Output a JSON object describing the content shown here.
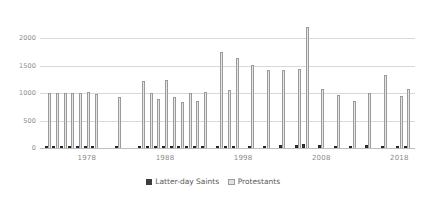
{
  "chart_data": {
    "type": "bar",
    "title": "",
    "subtitle": "",
    "xlabel": "",
    "ylabel": "",
    "ylim": [
      0,
      2300
    ],
    "grid": true,
    "legend_position": "bottom-center",
    "y_ticks": [
      0,
      500,
      1000,
      1500,
      2000
    ],
    "y_tick_labels": [
      "0",
      "500",
      "1000",
      "1500",
      "2000"
    ],
    "x_tick_values": [
      1978,
      1988,
      1998,
      2008,
      2018
    ],
    "x_tick_labels": [
      "1978",
      "1988",
      "1998",
      "2008",
      "2018"
    ],
    "x_domain": [
      1972,
      2020
    ],
    "colors": {
      "latter_day_saints": "#3d3d3d",
      "protestants": "#e2e2e2",
      "protestants_outline": "#9a9a9a",
      "gridline": "#d9d9d9",
      "axis_text": "#8a8a8a",
      "legend_text": "#5a5a5a",
      "background": "#ffffff"
    },
    "categories": [
      1973,
      1974,
      1975,
      1976,
      1977,
      1978,
      1979,
      1982,
      1985,
      1986,
      1987,
      1988,
      1989,
      1990,
      1991,
      1992,
      1993,
      1995,
      1996,
      1997,
      1999,
      2001,
      2003,
      2005,
      2006,
      2008,
      2010,
      2012,
      2014,
      2016,
      2018,
      2019
    ],
    "series": [
      {
        "name": "Latter-day Saints",
        "values": [
          25,
          25,
          30,
          30,
          30,
          35,
          30,
          25,
          35,
          30,
          35,
          40,
          35,
          45,
          40,
          35,
          40,
          40,
          45,
          45,
          45,
          45,
          50,
          50,
          70,
          50,
          45,
          45,
          50,
          45,
          45,
          45
        ]
      },
      {
        "name": "Protestants",
        "values": [
          1010,
          1000,
          1010,
          1000,
          1010,
          1030,
          990,
          940,
          1225,
          1000,
          900,
          1245,
          930,
          840,
          1010,
          860,
          1020,
          1760,
          1050,
          1640,
          1510,
          1430,
          1420,
          1440,
          2200,
          1080,
          960,
          860,
          1010,
          1340,
          950,
          1080
        ]
      }
    ]
  },
  "legend": {
    "items": [
      {
        "label": "Latter-day Saints",
        "key": "latter_day_saints"
      },
      {
        "label": "Protestants",
        "key": "protestants"
      }
    ]
  }
}
